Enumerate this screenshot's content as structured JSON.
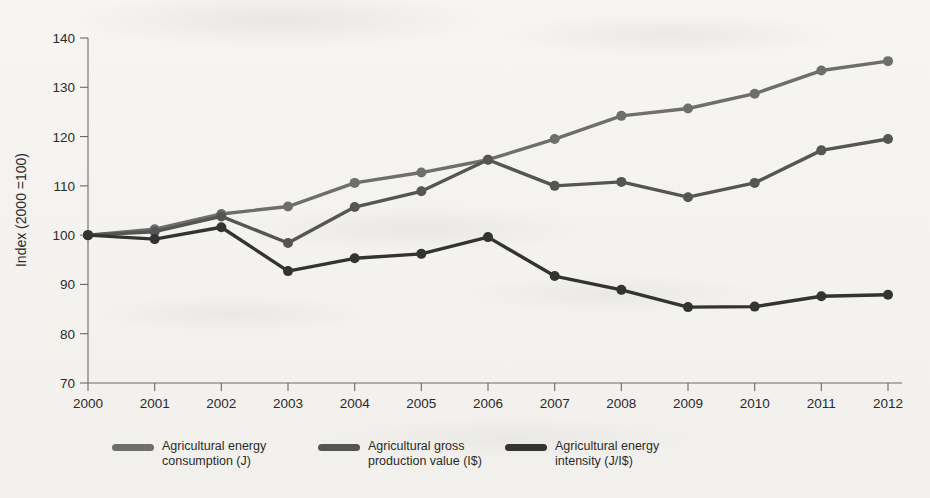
{
  "chart_data": {
    "type": "line",
    "title": "",
    "xlabel": "",
    "ylabel": "Index (2000 =100)",
    "categories": [
      "2000",
      "2001",
      "2002",
      "2003",
      "2004",
      "2005",
      "2006",
      "2007",
      "2008",
      "2009",
      "2010",
      "2011",
      "2012"
    ],
    "x": [
      2000,
      2001,
      2002,
      2003,
      2004,
      2005,
      2006,
      2007,
      2008,
      2009,
      2010,
      2011,
      2012
    ],
    "ylim": [
      70,
      140
    ],
    "yticks": [
      70,
      80,
      90,
      100,
      110,
      120,
      130,
      140
    ],
    "ytick_labels": [
      "70",
      "80",
      "90",
      "100",
      "110",
      "120",
      "130",
      "140"
    ],
    "grid": false,
    "legend_position": "bottom",
    "markers": true,
    "series": [
      {
        "name": "Agricultural energy consumption (J)",
        "color": "#6e6e6e",
        "values": [
          100.0,
          101.2,
          104.3,
          105.8,
          110.6,
          112.7,
          115.3,
          119.5,
          124.2,
          125.7,
          128.7,
          133.4,
          135.3
        ]
      },
      {
        "name": "Agricultural gross production value (I$)",
        "color": "#555555",
        "values": [
          100.0,
          100.7,
          103.8,
          98.4,
          105.7,
          108.9,
          115.3,
          110.0,
          110.8,
          107.7,
          110.6,
          117.2,
          119.5
        ]
      },
      {
        "name": "Agricultural energy intensity (J/I$)",
        "color": "#333333",
        "values": [
          100.0,
          99.2,
          101.6,
          92.7,
          95.3,
          96.2,
          99.6,
          91.7,
          88.9,
          85.4,
          85.5,
          87.6,
          87.9
        ]
      }
    ]
  },
  "legend": {
    "items": [
      {
        "label_line1": "Agricultural energy",
        "label_line2": "consumption (J)",
        "color": "#6e6e6e"
      },
      {
        "label_line1": "Agricultural gross",
        "label_line2": "production value (I$)",
        "color": "#555555"
      },
      {
        "label_line1": "Agricultural energy",
        "label_line2": "intensity (J/I$)",
        "color": "#333333"
      }
    ]
  },
  "axes": {
    "y_axis_title": "Index (2000 =100)"
  }
}
